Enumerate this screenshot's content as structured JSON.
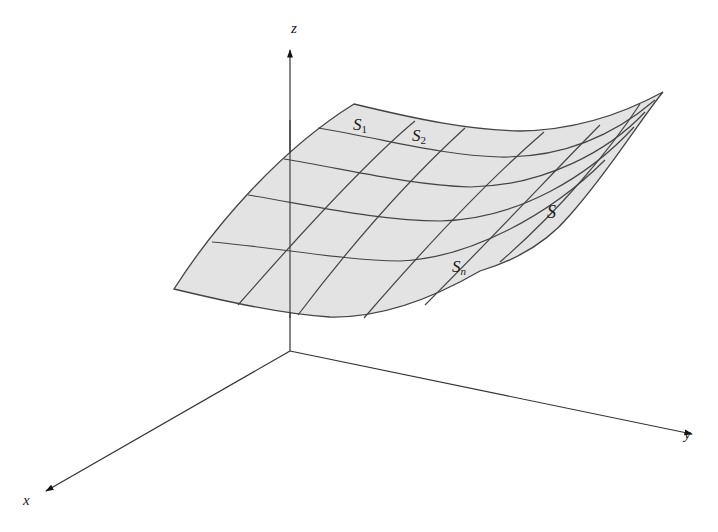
{
  "diagram": {
    "type": "3d-surface-partition",
    "axes": {
      "x": {
        "label": "x"
      },
      "y": {
        "label": "y"
      },
      "z": {
        "label": "z"
      }
    },
    "surface": {
      "label": "S",
      "fill": "#e3e3e3",
      "grid_color": "#444444"
    },
    "patches": [
      {
        "label": "S",
        "subscript": "1"
      },
      {
        "label": "S",
        "subscript": "2"
      },
      {
        "label": "S",
        "subscript": "n"
      }
    ]
  }
}
